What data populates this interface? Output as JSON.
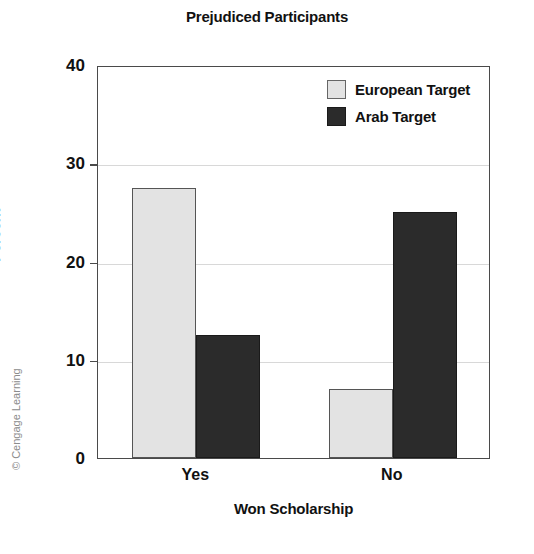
{
  "chart_data": {
    "type": "bar",
    "title": "Prejudiced Participants",
    "xlabel": "Won Scholarship",
    "ylabel": "Percent",
    "categories": [
      "Yes",
      "No"
    ],
    "series": [
      {
        "name": "European Target",
        "values": [
          27.5,
          7.0
        ],
        "color": "#e3e3e3"
      },
      {
        "name": "Arab Target",
        "values": [
          12.5,
          25.0
        ],
        "color": "#2b2b2b"
      }
    ],
    "ylim": [
      0,
      40
    ],
    "yticks": [
      0,
      10,
      20,
      30,
      40
    ],
    "ytick_labels": [
      "0",
      "10",
      "20",
      "30",
      "40"
    ],
    "grid": true,
    "grid_axis": "y",
    "legend_position": "top-right-inside"
  },
  "legend": {
    "entries": [
      {
        "label": "European Target",
        "swatch": "light-gray-square"
      },
      {
        "label": "Arab Target",
        "swatch": "dark-square"
      }
    ]
  },
  "attribution": {
    "text": "© Cengage Learning"
  },
  "colors": {
    "european": "#e3e3e3",
    "arab": "#2b2b2b",
    "axis": "#4a4a4a",
    "grid": "#d8d8d8",
    "text": "#111111",
    "watermark": "#8c8c8c"
  }
}
